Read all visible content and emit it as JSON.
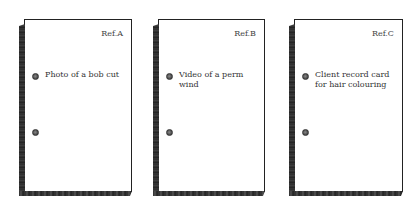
{
  "cards": [
    {
      "ref": "Ref.A",
      "label": "Photo of a bob cut"
    },
    {
      "ref": "Ref.B",
      "label": "Video of a perm wind"
    },
    {
      "ref": "Ref.C",
      "label": "Client record card\nfor hair colouring"
    }
  ]
}
